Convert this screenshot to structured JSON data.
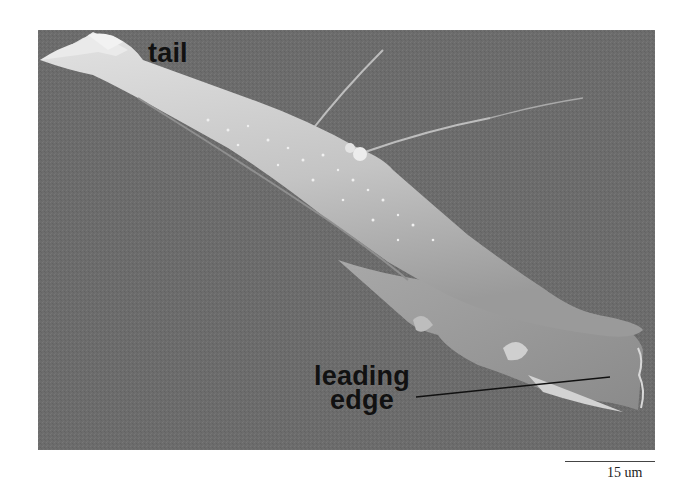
{
  "figure": {
    "type": "scanning electron micrograph",
    "labels": {
      "tail": "tail",
      "leading_line1": "leading",
      "leading_line2": "edge"
    },
    "scale_bar": {
      "text": "15 um"
    },
    "colors": {
      "background": "#6c6c6c",
      "cell": "#c9c9c9",
      "cell_highlight": "#e6e6e6",
      "label_text": "#111111",
      "page": "#ffffff"
    }
  }
}
